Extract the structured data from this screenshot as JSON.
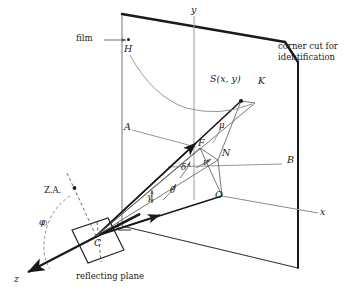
{
  "figure": {
    "stroke_color": "#1a1a1a",
    "thin_color": "#8a8a8a",
    "background": "#ffffff"
  },
  "annotations": {
    "film": "film",
    "corner_cut_line1": "corner cut for",
    "corner_cut_line2": "identification",
    "reflecting_plane": "reflecting plane",
    "zenith_axis": "Z.A."
  },
  "points": {
    "H": "H",
    "K": "K",
    "S": "S(x, y)",
    "A": "A",
    "B": "B",
    "F": "F",
    "N": "N",
    "O": "O",
    "C": "C"
  },
  "axes": {
    "x": "x",
    "y": "y",
    "z": "z"
  },
  "angles": {
    "mu": "μ",
    "delta": "δ",
    "nu": "ν",
    "theta": "θ",
    "gamma": "γ",
    "phi": "φ"
  }
}
